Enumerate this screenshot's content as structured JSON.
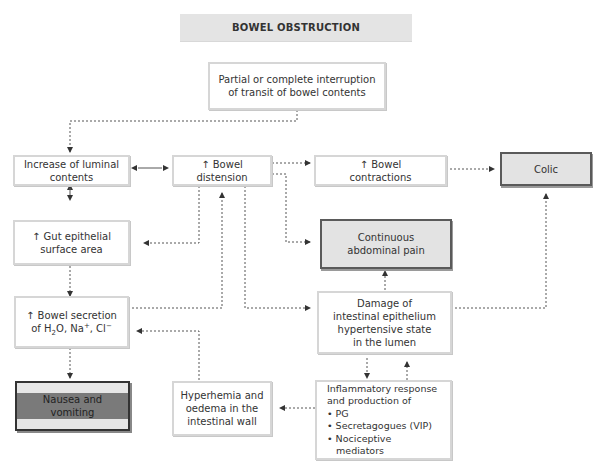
{
  "title": "BOWEL OBSTRUCTION",
  "nodes": {
    "interruption": {
      "line1": "Partial or complete interruption",
      "line2": "of transit of bowel contents"
    },
    "luminal": {
      "line1": "Increase of luminal",
      "line2": "contents"
    },
    "distension": {
      "line1": "↑ Bowel",
      "line2": "distension"
    },
    "contractions": {
      "line1": "↑ Bowel",
      "line2": "contractions"
    },
    "colic": {
      "line1": "Colic"
    },
    "epithelial_area": {
      "line1": "↑ Gut epithelial",
      "line2": "surface area"
    },
    "abdominal_pain": {
      "line1": "Continuous",
      "line2": "abdominal pain"
    },
    "secretion": {
      "line1": "↑ Bowel secretion",
      "line2_prefix": "of H",
      "line2_sub": "2",
      "line2_mid": "O, Na",
      "line2_sup1": "+",
      "line2_mid2": ", Cl",
      "line2_sup2": "−"
    },
    "damage": {
      "line1": "Damage of",
      "line2": "intestinal epithelium",
      "line3": "hypertensive state",
      "line4": "in the lumen"
    },
    "nausea": {
      "line1": "Nausea and",
      "line2": "vomiting"
    },
    "hyperhemia": {
      "line1": "Hyperhemia and",
      "line2": "oedema in the",
      "line3": "intestinal wall"
    },
    "inflammatory": {
      "line1": "Inflammatory response",
      "line2": "and production of",
      "items": [
        "• PG",
        "• Secretagogues (VIP)",
        "• Nociceptive",
        "   mediators"
      ]
    }
  },
  "colors": {
    "box_border": "#d6d6d6",
    "highlight_fill": "#e3e3e3",
    "nausea_band": "#7a7a7a",
    "line": "#555555"
  }
}
